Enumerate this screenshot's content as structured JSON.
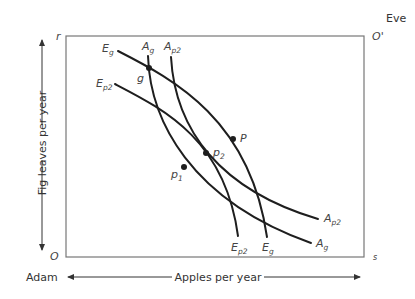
{
  "diagram": {
    "type": "edgeworth-box",
    "origin_bottom_left": {
      "label": "O",
      "owner": "Adam"
    },
    "origin_top_right": {
      "label": "O'",
      "owner": "Eve"
    },
    "corner_labels": {
      "top_left": "r",
      "bottom_right": "s"
    },
    "x_axis": {
      "label": "Apples per year",
      "left_label": "Adam"
    },
    "y_axis": {
      "label": "Fig leaves per year"
    },
    "curves": [
      {
        "id": "Eg",
        "label": "E",
        "subscript": "g",
        "kind": "Eve indifference curve"
      },
      {
        "id": "Ep2",
        "label": "E",
        "subscript": "p2",
        "kind": "Eve indifference curve"
      },
      {
        "id": "Ag",
        "label": "A",
        "subscript": "g",
        "kind": "Adam indifference curve"
      },
      {
        "id": "Ap2",
        "label": "A",
        "subscript": "p2",
        "kind": "Adam indifference curve"
      }
    ],
    "points": [
      {
        "id": "g",
        "label": "g"
      },
      {
        "id": "P",
        "label": "P"
      },
      {
        "id": "p2",
        "label": "p",
        "subscript": "2"
      },
      {
        "id": "p1",
        "label": "p",
        "subscript": "1"
      }
    ]
  }
}
